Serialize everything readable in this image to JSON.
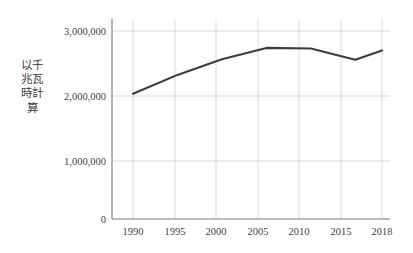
{
  "chart_data": {
    "type": "line",
    "title": "",
    "subtitle": "",
    "xlabel": "",
    "ylabel": "以千兆瓦時計算",
    "categories": [
      "1990",
      "1995",
      "2000",
      "2005",
      "2010",
      "2015",
      "2018"
    ],
    "x": [
      1990,
      1995,
      2000,
      2005,
      2010,
      2015,
      2018
    ],
    "values": [
      2000000,
      2300000,
      2550000,
      2730000,
      2720000,
      2540000,
      2690000
    ],
    "series": [
      {
        "name": "",
        "values": [
          2000000,
          2300000,
          2550000,
          2730000,
          2720000,
          2540000,
          2690000
        ]
      }
    ],
    "ylim": [
      0,
      3150000
    ],
    "xlim": [
      1988,
      2021
    ],
    "ytick_values": [
      0,
      1000000,
      2000000,
      3000000
    ],
    "ytick_labels": [
      "0",
      "1,000,000",
      "2,000,000",
      "3,000,000"
    ],
    "xtick_labels": [
      "1990",
      "1995",
      "2000",
      "2005",
      "2010",
      "2015",
      "2018"
    ],
    "grid": true,
    "legend": false,
    "legend_position": "none",
    "line_color": "#3d3d3d",
    "grid_color": "#d2d2d2",
    "axis_color": "#7a7a7a",
    "background_color": "#ffffff",
    "annotations": []
  },
  "axis": {
    "y_title": "以千兆瓦時計算",
    "y_ticks": [
      {
        "label": "3,000,000",
        "value": 3000000
      },
      {
        "label": "2,000,000",
        "value": 2000000
      },
      {
        "label": "1,000,000",
        "value": 1000000
      },
      {
        "label": "0",
        "value": 0
      }
    ],
    "x_ticks": [
      {
        "label": "1990",
        "value": 1990
      },
      {
        "label": "1995",
        "value": 1995
      },
      {
        "label": "2000",
        "value": 2000
      },
      {
        "label": "2005",
        "value": 2005
      },
      {
        "label": "2010",
        "value": 2010
      },
      {
        "label": "2015",
        "value": 2015
      },
      {
        "label": "2018",
        "value": 2018
      }
    ]
  }
}
